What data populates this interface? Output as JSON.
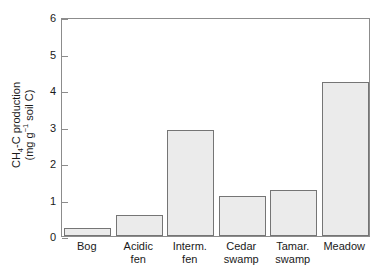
{
  "chart_data": {
    "type": "bar",
    "title": "",
    "xlabel": "",
    "ylabel": "CH4-C production (mg g-1 soil C)",
    "ylabel_parts": {
      "line1_pre": "CH",
      "line1_sub": "4",
      "line1_post": "-C production",
      "line2_pre": "(mg g",
      "line2_sup": "−1",
      "line2_post": " soil C)"
    },
    "categories": [
      "Bog",
      "Acidic fen",
      "Interm. fen",
      "Cedar swamp",
      "Tamar. swamp",
      "Meadow"
    ],
    "category_lines": [
      [
        "Bog"
      ],
      [
        "Acidic",
        "fen"
      ],
      [
        "Interm.",
        "fen"
      ],
      [
        "Cedar",
        "swamp"
      ],
      [
        "Tamar.",
        "swamp"
      ],
      [
        "Meadow"
      ]
    ],
    "values": [
      0.22,
      0.58,
      2.9,
      1.1,
      1.27,
      4.23
    ],
    "ylim": [
      0,
      6
    ],
    "yticks": [
      0,
      1,
      2,
      3,
      4,
      5,
      6
    ],
    "ytick_labels": [
      "0",
      "1",
      "2",
      "3",
      "4",
      "5",
      "6"
    ],
    "grid": false,
    "legend": null,
    "bar_fill_color": "#ebebeb",
    "bar_edge_color": "#757575",
    "axis_color": "#8c8c8c",
    "background_color": "#ffffff"
  }
}
